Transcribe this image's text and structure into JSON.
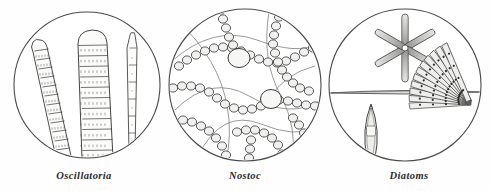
{
  "figure": {
    "background_color": "#fefefe",
    "ink_color": "#3a3a3a",
    "cell_fill_color": "#f2f2f0",
    "width": 491,
    "height": 191
  },
  "panels": [
    {
      "id": "oscillatoria",
      "caption": "Oscillatoria",
      "center_x": 87,
      "center_y": 85,
      "radius": 73,
      "description": "Three banded filaments with rounded apical tips seen through a circular microscope field",
      "specimens": [
        {
          "name": "filament-left",
          "cells": 13,
          "tip": "rounded"
        },
        {
          "name": "filament-center",
          "cells": 11,
          "tip": "rounded-broad"
        },
        {
          "name": "filament-right",
          "cells": 7,
          "tip": "tapered"
        }
      ]
    },
    {
      "id": "nostoc",
      "caption": "Nostoc",
      "center_x": 245,
      "center_y": 85,
      "radius": 78,
      "description": "Beaded chains of spherical cells woven through a gelatinous matrix with two enlarged heterocysts",
      "specimens": [
        {
          "name": "bead-chain",
          "count": 9
        },
        {
          "name": "heterocyst",
          "count": 2
        }
      ]
    },
    {
      "id": "diatoms",
      "caption": "Diatoms",
      "center_x": 404,
      "center_y": 85,
      "radius": 76,
      "description": "Star colony of six rod diatoms, a long needle frustule, a boat-shaped navicula and a fan-shaped colony",
      "specimens": [
        {
          "name": "asterionella-star",
          "rays": 6
        },
        {
          "name": "synedra-needle",
          "count": 1
        },
        {
          "name": "navicula-boat",
          "count": 1
        },
        {
          "name": "meridion-fan",
          "wedges": 13
        }
      ]
    }
  ]
}
